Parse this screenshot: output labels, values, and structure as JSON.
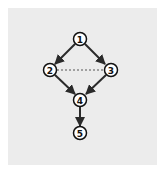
{
  "diagram": {
    "type": "directed-graph",
    "colors": {
      "background": "#ffffff",
      "panel": "#ececec",
      "edge": "#2a2a2a",
      "node_fill": "#ffffff",
      "node_stroke": "#111111",
      "dashed_edge": "#555555"
    },
    "nodes": [
      {
        "id": "1",
        "label": "1",
        "x": 80,
        "y": 39
      },
      {
        "id": "2",
        "label": "2",
        "x": 50,
        "y": 70
      },
      {
        "id": "3",
        "label": "3",
        "x": 111,
        "y": 70
      },
      {
        "id": "4",
        "label": "4",
        "x": 80,
        "y": 100
      },
      {
        "id": "5",
        "label": "5",
        "x": 80,
        "y": 133
      }
    ],
    "edges": [
      {
        "from": "1",
        "to": "2",
        "style": "solid",
        "directed": true
      },
      {
        "from": "1",
        "to": "3",
        "style": "solid",
        "directed": true
      },
      {
        "from": "2",
        "to": "4",
        "style": "solid",
        "directed": true
      },
      {
        "from": "3",
        "to": "4",
        "style": "solid",
        "directed": true
      },
      {
        "from": "4",
        "to": "5",
        "style": "solid",
        "directed": true
      },
      {
        "from": "2",
        "to": "3",
        "style": "dashed",
        "directed": false
      }
    ]
  }
}
